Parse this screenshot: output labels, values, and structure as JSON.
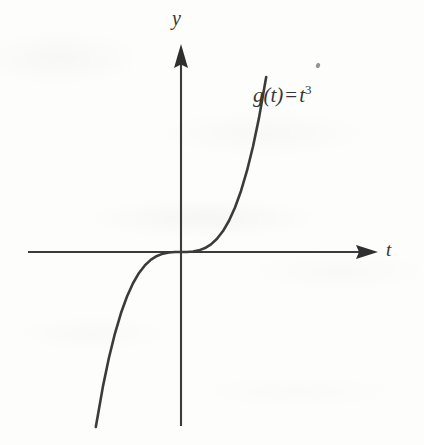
{
  "figure": {
    "name": "cubic-function-graph",
    "background_color": "#fdfdfc",
    "ink_color": "#3b3b3b",
    "width": 424,
    "height": 445
  },
  "labels": {
    "y_axis": "y",
    "t_axis": "t",
    "equation_function": "g(t)",
    "equation_operator": "=",
    "equation_base": "t",
    "equation_exponent": "3"
  },
  "chart_data": {
    "type": "line",
    "title": "",
    "subtitle": "",
    "xlabel": "t",
    "ylabel": "y",
    "legend": [],
    "annotations": [
      "g(t) = t^3"
    ],
    "grid": false,
    "axes": {
      "style": "cartesian-cross-with-arrows",
      "x_arrow": true,
      "y_arrow": true,
      "x_tick_labels": [],
      "y_tick_labels": [],
      "origin_px": [
        181,
        252
      ],
      "xlim": [
        -2.55,
        2.55
      ],
      "ylim": [
        -2.85,
        2.85
      ]
    },
    "series": [
      {
        "name": "g(t) = t^3",
        "equation": "y = t^3",
        "color": "#3b3b3b",
        "x": [
          -1.42,
          -1.3,
          -1.2,
          -1.1,
          -1.0,
          -0.9,
          -0.8,
          -0.7,
          -0.6,
          -0.5,
          -0.4,
          -0.3,
          -0.2,
          -0.1,
          0.0,
          0.1,
          0.2,
          0.3,
          0.4,
          0.5,
          0.6,
          0.7,
          0.8,
          0.9,
          1.0,
          1.1,
          1.2,
          1.3,
          1.42
        ],
        "y": [
          -2.865,
          -2.197,
          -1.728,
          -1.331,
          -1.0,
          -0.729,
          -0.512,
          -0.343,
          -0.216,
          -0.125,
          -0.064,
          -0.027,
          -0.008,
          -0.001,
          0.0,
          0.001,
          0.008,
          0.027,
          0.064,
          0.125,
          0.216,
          0.343,
          0.512,
          0.729,
          1.0,
          1.331,
          1.728,
          2.197,
          2.865
        ]
      }
    ]
  }
}
